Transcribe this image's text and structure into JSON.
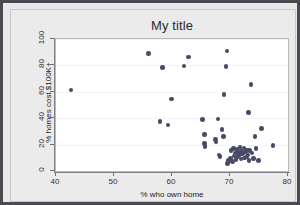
{
  "chart_data": {
    "type": "scatter",
    "title": "My title",
    "xlabel": "% who own home",
    "ylabel": "% homes cost $100K+",
    "xlim": [
      40,
      80
    ],
    "ylim": [
      0,
      100
    ],
    "xticks": [
      40,
      50,
      60,
      70,
      80
    ],
    "yticks": [
      0,
      20,
      40,
      60,
      80,
      100
    ],
    "grid": true,
    "legend": null,
    "marker_color": "#4a4a66",
    "background_color": "#ffffff",
    "frame_color": "#4a4a52",
    "points": [
      {
        "x": 42.6,
        "y": 61.5
      },
      {
        "x": 55.9,
        "y": 89.0
      },
      {
        "x": 58.4,
        "y": 78.5
      },
      {
        "x": 57.9,
        "y": 37.5
      },
      {
        "x": 59.3,
        "y": 35.0
      },
      {
        "x": 59.9,
        "y": 54.5
      },
      {
        "x": 62.1,
        "y": 79.5
      },
      {
        "x": 62.8,
        "y": 86.5
      },
      {
        "x": 65.3,
        "y": 39.0
      },
      {
        "x": 65.6,
        "y": 27.5
      },
      {
        "x": 65.6,
        "y": 21.0
      },
      {
        "x": 65.7,
        "y": 18.5
      },
      {
        "x": 67.5,
        "y": 24.0
      },
      {
        "x": 67.6,
        "y": 22.0
      },
      {
        "x": 67.9,
        "y": 39.5
      },
      {
        "x": 68.1,
        "y": 12.0
      },
      {
        "x": 68.3,
        "y": 11.0
      },
      {
        "x": 68.6,
        "y": 31.5
      },
      {
        "x": 68.9,
        "y": 26.0
      },
      {
        "x": 69.0,
        "y": 58.0
      },
      {
        "x": 69.3,
        "y": 79.0
      },
      {
        "x": 69.5,
        "y": 91.0
      },
      {
        "x": 69.6,
        "y": 5.5
      },
      {
        "x": 69.7,
        "y": 8.0
      },
      {
        "x": 70.1,
        "y": 9.5
      },
      {
        "x": 70.2,
        "y": 15.5
      },
      {
        "x": 70.4,
        "y": 7.0
      },
      {
        "x": 70.6,
        "y": 17.0
      },
      {
        "x": 70.7,
        "y": 11.5
      },
      {
        "x": 70.9,
        "y": 13.5
      },
      {
        "x": 71.0,
        "y": 8.5
      },
      {
        "x": 71.2,
        "y": 16.5
      },
      {
        "x": 71.3,
        "y": 10.5
      },
      {
        "x": 71.4,
        "y": 14.0
      },
      {
        "x": 71.6,
        "y": 12.5
      },
      {
        "x": 71.7,
        "y": 18.0
      },
      {
        "x": 71.9,
        "y": 9.0
      },
      {
        "x": 72.0,
        "y": 15.0
      },
      {
        "x": 72.2,
        "y": 13.0
      },
      {
        "x": 72.4,
        "y": 17.5
      },
      {
        "x": 72.5,
        "y": 10.0
      },
      {
        "x": 72.7,
        "y": 14.5
      },
      {
        "x": 72.8,
        "y": 16.0
      },
      {
        "x": 72.9,
        "y": 11.0
      },
      {
        "x": 73.1,
        "y": 12.0
      },
      {
        "x": 73.2,
        "y": 44.5
      },
      {
        "x": 73.3,
        "y": 8.0
      },
      {
        "x": 73.4,
        "y": 15.5
      },
      {
        "x": 73.6,
        "y": 65.5
      },
      {
        "x": 73.8,
        "y": 13.5
      },
      {
        "x": 74.1,
        "y": 9.5
      },
      {
        "x": 74.3,
        "y": 26.0
      },
      {
        "x": 74.5,
        "y": 17.0
      },
      {
        "x": 74.9,
        "y": 8.0
      },
      {
        "x": 75.4,
        "y": 32.0
      },
      {
        "x": 77.4,
        "y": 19.5
      }
    ]
  }
}
